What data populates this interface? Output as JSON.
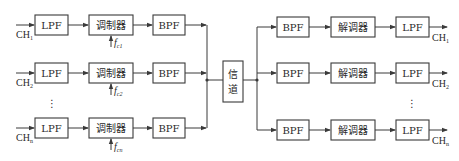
{
  "diagram": {
    "transmitter": {
      "branches": [
        {
          "input": "CH",
          "input_sub": "1",
          "lpf": "LPF",
          "modulator": "调制器",
          "carrier": "f",
          "carrier_sub": "c1",
          "bpf": "BPF"
        },
        {
          "input": "CH",
          "input_sub": "2",
          "lpf": "LPF",
          "modulator": "调制器",
          "carrier": "f",
          "carrier_sub": "c2",
          "bpf": "BPF"
        },
        {
          "input": "CH",
          "input_sub": "n",
          "lpf": "LPF",
          "modulator": "调制器",
          "carrier": "f",
          "carrier_sub": "cn",
          "bpf": "BPF"
        }
      ],
      "ellipsis": "⋮"
    },
    "channel": {
      "line1": "信",
      "line2": "道"
    },
    "receiver": {
      "branches": [
        {
          "bpf": "BPF",
          "demodulator": "解调器",
          "lpf": "LPF",
          "output": "CH",
          "output_sub": "1"
        },
        {
          "bpf": "BPF",
          "demodulator": "解调器",
          "lpf": "LPF",
          "output": "CH",
          "output_sub": "2"
        },
        {
          "bpf": "BPF",
          "demodulator": "解调器",
          "lpf": "LPF",
          "output": "CH",
          "output_sub": "n"
        }
      ],
      "ellipsis": "⋮"
    },
    "colors": {
      "stroke": "#3a3a3a",
      "text": "#2a2a2a",
      "background": "#ffffff"
    }
  }
}
